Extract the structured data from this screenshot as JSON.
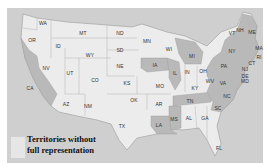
{
  "map": {
    "title": "US states map with territories without full representation",
    "colors": {
      "water": "#cfcfcf",
      "light_state": "#ececec",
      "dark_state": "#b9b9b9",
      "border": "#9a9a9a"
    },
    "states": [
      {
        "abbr": "WA",
        "x": 36,
        "y": 15,
        "shade": "light"
      },
      {
        "abbr": "OR",
        "x": 25,
        "y": 32,
        "shade": "light"
      },
      {
        "abbr": "CA",
        "x": 23,
        "y": 80,
        "shade": "dark"
      },
      {
        "abbr": "ID",
        "x": 51,
        "y": 38,
        "shade": "light"
      },
      {
        "abbr": "NV",
        "x": 39,
        "y": 60,
        "shade": "light"
      },
      {
        "abbr": "MT",
        "x": 76,
        "y": 25,
        "shade": "light"
      },
      {
        "abbr": "WY",
        "x": 83,
        "y": 47,
        "shade": "light"
      },
      {
        "abbr": "UT",
        "x": 63,
        "y": 65,
        "shade": "light"
      },
      {
        "abbr": "CO",
        "x": 88,
        "y": 72,
        "shade": "light"
      },
      {
        "abbr": "AZ",
        "x": 59,
        "y": 96,
        "shade": "light"
      },
      {
        "abbr": "NM",
        "x": 81,
        "y": 98,
        "shade": "light"
      },
      {
        "abbr": "ND",
        "x": 113,
        "y": 25,
        "shade": "light"
      },
      {
        "abbr": "SD",
        "x": 113,
        "y": 42,
        "shade": "light"
      },
      {
        "abbr": "NE",
        "x": 113,
        "y": 58,
        "shade": "light"
      },
      {
        "abbr": "KS",
        "x": 120,
        "y": 75,
        "shade": "light"
      },
      {
        "abbr": "OK",
        "x": 127,
        "y": 92,
        "shade": "light"
      },
      {
        "abbr": "TX",
        "x": 115,
        "y": 118,
        "shade": "light"
      },
      {
        "abbr": "MN",
        "x": 140,
        "y": 33,
        "shade": "light"
      },
      {
        "abbr": "IA",
        "x": 148,
        "y": 57,
        "shade": "dark"
      },
      {
        "abbr": "MO",
        "x": 153,
        "y": 78,
        "shade": "light"
      },
      {
        "abbr": "AR",
        "x": 152,
        "y": 96,
        "shade": "light"
      },
      {
        "abbr": "LA",
        "x": 152,
        "y": 117,
        "shade": "dark"
      },
      {
        "abbr": "WI",
        "x": 162,
        "y": 41,
        "shade": "light"
      },
      {
        "abbr": "IL",
        "x": 168,
        "y": 65,
        "shade": "dark"
      },
      {
        "abbr": "MI",
        "x": 185,
        "y": 48,
        "shade": "dark"
      },
      {
        "abbr": "IN",
        "x": 180,
        "y": 64,
        "shade": "light"
      },
      {
        "abbr": "OH",
        "x": 196,
        "y": 63,
        "shade": "light"
      },
      {
        "abbr": "KY",
        "x": 188,
        "y": 80,
        "shade": "light"
      },
      {
        "abbr": "TN",
        "x": 183,
        "y": 93,
        "shade": "dark"
      },
      {
        "abbr": "MS",
        "x": 167,
        "y": 111,
        "shade": "dark"
      },
      {
        "abbr": "AL",
        "x": 182,
        "y": 110,
        "shade": "light"
      },
      {
        "abbr": "GA",
        "x": 198,
        "y": 110,
        "shade": "light"
      },
      {
        "abbr": "FL",
        "x": 212,
        "y": 140,
        "shade": "light"
      },
      {
        "abbr": "SC",
        "x": 211,
        "y": 100,
        "shade": "dark"
      },
      {
        "abbr": "NC",
        "x": 220,
        "y": 88,
        "shade": "dark"
      },
      {
        "abbr": "VA",
        "x": 216,
        "y": 75,
        "shade": "dark"
      },
      {
        "abbr": "WV",
        "x": 203,
        "y": 73,
        "shade": "dark"
      },
      {
        "abbr": "PA",
        "x": 217,
        "y": 58,
        "shade": "dark"
      },
      {
        "abbr": "NY",
        "x": 225,
        "y": 43,
        "shade": "dark"
      },
      {
        "abbr": "VT",
        "x": 225,
        "y": 25,
        "shade": "dark"
      },
      {
        "abbr": "NH",
        "x": 233,
        "y": 22,
        "shade": "dark"
      },
      {
        "abbr": "ME",
        "x": 245,
        "y": 24,
        "shade": "dark"
      },
      {
        "abbr": "MA",
        "x": 252,
        "y": 40,
        "shade": "dark"
      },
      {
        "abbr": "RI",
        "x": 252,
        "y": 49,
        "shade": "dark"
      },
      {
        "abbr": "CT",
        "x": 245,
        "y": 55,
        "shade": "dark"
      },
      {
        "abbr": "NJ",
        "x": 238,
        "y": 61,
        "shade": "dark"
      },
      {
        "abbr": "DE",
        "x": 238,
        "y": 68,
        "shade": "dark"
      },
      {
        "abbr": "MD",
        "x": 238,
        "y": 73,
        "shade": "dark"
      }
    ]
  },
  "legend": {
    "line1": "Territories without",
    "line2": "full representation",
    "swatch_color": "#e6e6e6"
  }
}
